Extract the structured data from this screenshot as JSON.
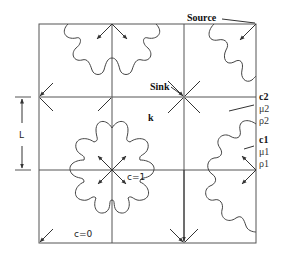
{
  "diagram": {
    "title": "",
    "labels": {
      "source": "Source",
      "sink": "Sink",
      "permeability": "k",
      "length": "L",
      "conc_inside": "c=1",
      "conc_outside": "c=0",
      "fluid2_conc": "c2",
      "fluid2_visc": "μ2",
      "fluid2_dens": "ρ2",
      "fluid1_conc": "c1",
      "fluid1_visc": "μ1",
      "fluid1_dens": "ρ1"
    },
    "grid": {
      "x_lines": [
        39,
        112,
        184,
        256
      ],
      "y_lines": [
        24,
        97,
        170,
        243
      ]
    },
    "colors": {
      "line": "#555555",
      "text": "#111111",
      "background": "#ffffff"
    }
  }
}
